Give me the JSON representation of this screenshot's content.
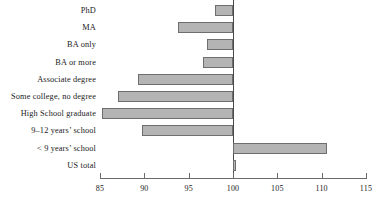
{
  "chart_data": {
    "type": "bar",
    "orientation": "horizontal",
    "title": "",
    "subtitle": "",
    "xlabel": "",
    "ylabel": "",
    "xlim": [
      85,
      115
    ],
    "xticks": [
      85,
      90,
      95,
      100,
      105,
      110,
      115
    ],
    "xtick_labels": [
      "85",
      "90",
      "95",
      "100",
      "105",
      "110",
      "115"
    ],
    "baseline": 100,
    "grid": false,
    "legend": null,
    "bar_fill_color": "#b4b4b4",
    "bar_border_color": "#6e6e6e",
    "axis_color": "#6b6b6b",
    "categories": [
      "PhD",
      "MA",
      "BA only",
      "BA or more",
      "Associate degree",
      "Some college, no degree",
      "High School graduate",
      "9–12 years’ school",
      "< 9 years’ school",
      "US total"
    ],
    "values": [
      98.0,
      93.8,
      97.1,
      96.6,
      89.3,
      87.0,
      85.2,
      89.7,
      110.6,
      100.3
    ]
  }
}
